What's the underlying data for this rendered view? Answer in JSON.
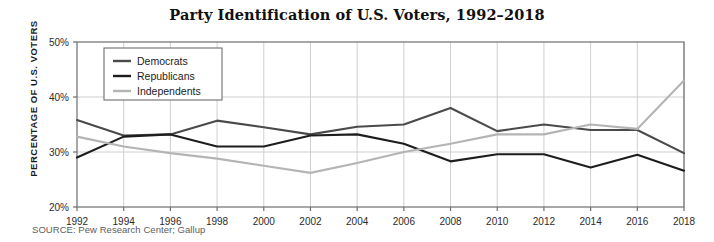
{
  "figure": {
    "title": "Party Identification of U.S. Voters, 1992–2018",
    "source": "SOURCE: Pew Research Center; Gallup",
    "y_axis_title": "PERCENTAGE OF U.S. VOTERS"
  },
  "chart_data": {
    "type": "line",
    "title": "Party Identification of U.S. Voters, 1992–2018",
    "xlabel": "",
    "ylabel": "PERCENTAGE OF U.S. VOTERS",
    "xlim": [
      1992,
      2018
    ],
    "ylim": [
      20,
      50
    ],
    "yticks": [
      20,
      30,
      40,
      50
    ],
    "ytick_labels": [
      "20%",
      "30%",
      "40%",
      "50%"
    ],
    "grid": true,
    "legend_position": "top-left",
    "categories": [
      1992,
      1994,
      1996,
      1998,
      2000,
      2002,
      2004,
      2006,
      2008,
      2010,
      2012,
      2014,
      2016,
      2018
    ],
    "xtick_labels": [
      "1992",
      "1994",
      "1996",
      "1998",
      "2000",
      "2002",
      "2004",
      "2006",
      "2008",
      "2010",
      "2012",
      "2014",
      "2016",
      "2018"
    ],
    "series": [
      {
        "name": "Democrats",
        "color": "#4a4a4a",
        "values": [
          35.8,
          33.0,
          33.2,
          35.7,
          34.5,
          33.2,
          34.6,
          35.0,
          38.0,
          33.8,
          35.0,
          34.0,
          34.0,
          29.8
        ]
      },
      {
        "name": "Republicans",
        "color": "#1d1d1d",
        "values": [
          29.0,
          32.8,
          33.2,
          31.0,
          31.0,
          33.0,
          33.2,
          31.5,
          28.3,
          29.6,
          29.6,
          27.2,
          29.5,
          26.6
        ]
      },
      {
        "name": "Independents",
        "color": "#b4b4b4",
        "values": [
          32.8,
          31.0,
          29.8,
          28.8,
          27.5,
          26.2,
          28.0,
          30.0,
          31.5,
          33.2,
          33.2,
          35.0,
          34.2,
          43.0
        ]
      }
    ]
  },
  "legend": {
    "items": [
      {
        "label": "Democrats",
        "color": "#4a4a4a"
      },
      {
        "label": "Republicans",
        "color": "#1d1d1d"
      },
      {
        "label": "Independents",
        "color": "#b4b4b4"
      }
    ]
  },
  "colors": {
    "plot_frame": "#6e6e6e",
    "grid": "#cfcfcf",
    "background": "#ffffff",
    "title": "#111111",
    "source": "#5d5d5d"
  }
}
